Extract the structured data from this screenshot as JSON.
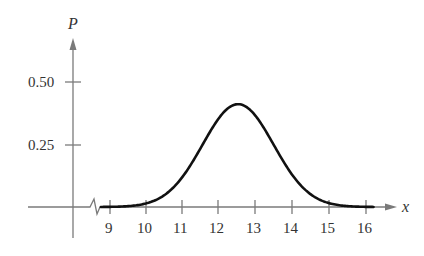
{
  "chart_data": {
    "type": "line",
    "title": "",
    "xlabel": "x",
    "ylabel": "P",
    "xlim": [
      9,
      16
    ],
    "ylim": [
      0,
      0.5
    ],
    "grid": false,
    "legend": null,
    "x_ticks": [
      "9",
      "10",
      "11",
      "12",
      "13",
      "14",
      "15",
      "16"
    ],
    "y_ticks": [
      "0.25",
      "0.50"
    ],
    "annotations": [
      "axis break symbol between origin and x = 9"
    ],
    "series": [
      {
        "name": "normal curve",
        "color": "#111111",
        "mean": 12.5,
        "std": 0.97,
        "x": [
          8.7,
          9,
          9.5,
          10,
          10.5,
          11,
          11.5,
          12,
          12.5,
          13,
          13.5,
          14,
          14.5,
          15,
          15.5,
          16,
          16.3
        ],
        "y": [
          0.0,
          0.001,
          0.004,
          0.015,
          0.05,
          0.125,
          0.243,
          0.361,
          0.411,
          0.361,
          0.243,
          0.125,
          0.05,
          0.015,
          0.004,
          0.001,
          0.0
        ]
      }
    ]
  },
  "axes": {
    "x_label": "x",
    "y_label": "P",
    "y_tick_labels": [
      "0.50",
      "0.25"
    ],
    "x_tick_labels": [
      "9",
      "10",
      "11",
      "12",
      "13",
      "14",
      "15",
      "16"
    ]
  }
}
